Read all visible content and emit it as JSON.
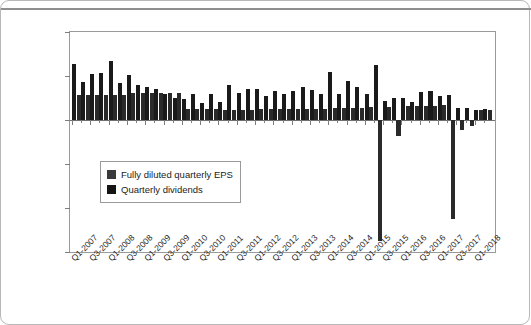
{
  "chart_data": {
    "type": "bar",
    "title": "",
    "subtitle": "",
    "xlabel": "",
    "ylabel": "",
    "ylim": [
      -1.5,
      1.0
    ],
    "grid": false,
    "legend_position": "inside-left",
    "y_ticks": [
      "$1.00",
      "$0.50",
      "$0.00",
      "-$0.50",
      "-$1.00",
      "-$1.50"
    ],
    "y_tick_values": [
      1.0,
      0.5,
      0.0,
      -0.5,
      -1.0,
      -1.5
    ],
    "categories": [
      "Q1-2007",
      "Q2-2007",
      "Q3-2007",
      "Q4-2007",
      "Q1-2008",
      "Q2-2008",
      "Q3-2008",
      "Q4-2008",
      "Q1-2009",
      "Q2-2009",
      "Q3-2009",
      "Q4-2009",
      "Q1-2010",
      "Q2-2010",
      "Q3-2010",
      "Q4-2010",
      "Q1-2011",
      "Q2-2011",
      "Q3-2011",
      "Q4-2011",
      "Q1-2012",
      "Q2-2012",
      "Q3-2012",
      "Q4-2012",
      "Q1-2013",
      "Q2-2013",
      "Q3-2013",
      "Q4-2013",
      "Q1-2014",
      "Q2-2014",
      "Q3-2014",
      "Q4-2014",
      "Q1-2015",
      "Q2-2015",
      "Q3-2015",
      "Q4-2015",
      "Q1-2016",
      "Q2-2016",
      "Q3-2016",
      "Q4-2016",
      "Q1-2017",
      "Q2-2017",
      "Q3-2017",
      "Q4-2017",
      "Q1-2018",
      "Q2-2018"
    ],
    "x_tick_labels": [
      "Q1-2007",
      "Q3-2007",
      "Q1-2008",
      "Q3-2008",
      "Q1-2009",
      "Q3-2009",
      "Q1-2010",
      "Q3-2010",
      "Q1-2011",
      "Q3-2011",
      "Q1-2012",
      "Q3-2012",
      "Q1-2013",
      "Q3-2013",
      "Q1-2014",
      "Q3-2014",
      "Q1-2015",
      "Q3-2015",
      "Q1-2016",
      "Q3-2016",
      "Q1-2017",
      "Q3-2017",
      "Q1-2018"
    ],
    "series": [
      {
        "name": "Fully diluted quarterly EPS",
        "color": "#1a1a1a",
        "values": [
          0.64,
          0.43,
          0.52,
          0.53,
          0.67,
          0.42,
          0.51,
          0.4,
          0.37,
          0.35,
          0.3,
          0.25,
          0.24,
          0.29,
          0.19,
          0.29,
          0.2,
          0.4,
          0.31,
          0.35,
          0.35,
          0.27,
          0.33,
          0.3,
          0.33,
          0.38,
          0.34,
          0.3,
          0.54,
          0.3,
          0.44,
          0.37,
          0.3,
          0.63,
          0.22,
          0.25,
          0.25,
          0.2,
          0.32,
          0.33,
          0.27,
          0.28,
          0.14,
          0.14,
          0.11,
          0.12
        ]
      },
      {
        "name": "Quarterly dividends",
        "color": "#2a2a2a",
        "values": [
          0.28,
          0.28,
          0.28,
          0.28,
          0.28,
          0.28,
          0.31,
          0.31,
          0.31,
          0.31,
          0.31,
          0.31,
          0.13,
          0.13,
          0.13,
          0.13,
          0.11,
          0.11,
          0.11,
          0.11,
          0.12,
          0.12,
          0.12,
          0.12,
          0.13,
          0.13,
          0.13,
          0.13,
          0.14,
          0.14,
          0.14,
          0.14,
          0.15,
          -1.38,
          0.15,
          -0.18,
          0.16,
          0.16,
          0.16,
          0.16,
          0.17,
          -1.13,
          -0.11,
          -0.07,
          0.11,
          0.11
        ]
      }
    ],
    "annotations": []
  },
  "legend": {
    "items": [
      {
        "label": "Fully diluted quarterly EPS",
        "color": "#3a3a3a"
      },
      {
        "label": "Quarterly dividends",
        "color": "#141414"
      }
    ]
  }
}
